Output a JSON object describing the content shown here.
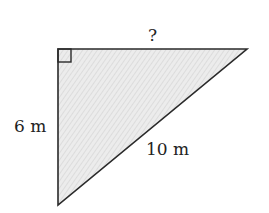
{
  "diagram": {
    "type": "right-triangle",
    "colors": {
      "stroke": "#2a2a2a",
      "fill": "#e9e9e9",
      "hatch": "#cfcfcf",
      "text": "#222222"
    },
    "vertices": {
      "right_angle": [
        58,
        49
      ],
      "top_right": [
        247,
        49
      ],
      "bottom": [
        58,
        205
      ]
    },
    "labels": {
      "top_side": "?",
      "left_side": "6 m",
      "hypotenuse": "10 m"
    }
  }
}
